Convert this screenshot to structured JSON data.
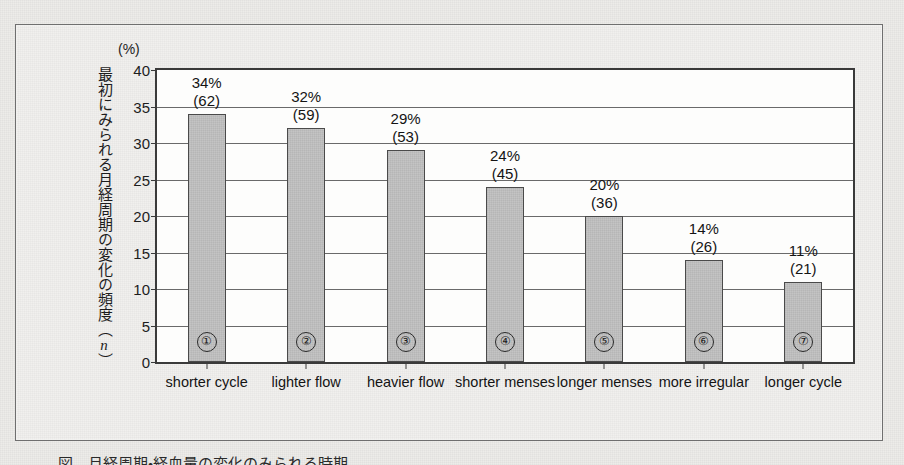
{
  "figure": {
    "caption": "図　月経周期・経血量の変化のみられる時期"
  },
  "colors": {
    "bar_fill": "#c4c4c4",
    "bar_border": "#4a4a4a",
    "axis": "#3a3a3a",
    "gridline": "#6a6a6a",
    "page_background": "#edece9",
    "plot_background": "#fdfdfc",
    "text": "#141414"
  },
  "chart_data": {
    "type": "bar",
    "title": "",
    "subtitle": "",
    "xlabel": "",
    "ylabel": "最初にみられる月経周期の変化の頻度（n）",
    "ylabel_parts": {
      "text": "最初にみられる月経周期の変化の頻度（",
      "italic": "n",
      "tail": "）"
    },
    "yunit": "(%)",
    "ylim": [
      0,
      40
    ],
    "ytick_step": 5,
    "yticks": [
      0,
      5,
      10,
      15,
      20,
      25,
      30,
      35,
      40
    ],
    "ytick_labels": [
      "0",
      "5",
      "10",
      "15",
      "20",
      "25",
      "30",
      "35",
      "40"
    ],
    "grid": true,
    "grid_axis": "y",
    "legend": false,
    "legend_position": "none",
    "categories": [
      "shorter cycle",
      "lighter flow",
      "heavier flow",
      "shorter menses",
      "longer menses",
      "more irregular",
      "longer cycle"
    ],
    "values": [
      34,
      32,
      29,
      24,
      20,
      14,
      11
    ],
    "counts": [
      62,
      59,
      53,
      45,
      36,
      26,
      21
    ],
    "markers": [
      "①",
      "②",
      "③",
      "④",
      "⑤",
      "⑥",
      "⑦"
    ],
    "percent_labels": [
      "34%",
      "32%",
      "29%",
      "24%",
      "20%",
      "14%",
      "11%"
    ],
    "count_labels": [
      "(62)",
      "(59)",
      "(53)",
      "(45)",
      "(36)",
      "(26)",
      "(21)"
    ],
    "bars": [
      {
        "marker": "①",
        "category": "shorter cycle",
        "percent": 34,
        "percent_label": "34%",
        "count": 62,
        "count_label": "(62)"
      },
      {
        "marker": "②",
        "category": "lighter flow",
        "percent": 32,
        "percent_label": "32%",
        "count": 59,
        "count_label": "(59)"
      },
      {
        "marker": "③",
        "category": "heavier flow",
        "percent": 29,
        "percent_label": "29%",
        "count": 53,
        "count_label": "(53)"
      },
      {
        "marker": "④",
        "category": "shorter menses",
        "percent": 24,
        "percent_label": "24%",
        "count": 45,
        "count_label": "(45)"
      },
      {
        "marker": "⑤",
        "category": "longer menses",
        "percent": 20,
        "percent_label": "20%",
        "count": 36,
        "count_label": "(36)"
      },
      {
        "marker": "⑥",
        "category": "more irregular",
        "percent": 14,
        "percent_label": "14%",
        "count": 26,
        "count_label": "(26)"
      },
      {
        "marker": "⑦",
        "category": "longer cycle",
        "percent": 11,
        "percent_label": "11%",
        "count": 21,
        "count_label": "(21)"
      }
    ]
  }
}
